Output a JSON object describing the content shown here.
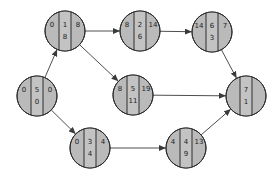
{
  "diagram": {
    "type": "network-activity-diagram",
    "node_radius": 20,
    "middle_half_width": 6,
    "colors": {
      "fill": "#bababa",
      "middle_fill": "#c3c3c3",
      "stroke": "#2e2e2e",
      "edge": "#3a3a3a",
      "text": "#222222"
    },
    "nodes": [
      {
        "id": "start",
        "cx": 37,
        "cy": 96,
        "left": "0",
        "mid_top": "5",
        "mid_bottom": "0",
        "right": "0"
      },
      {
        "id": "a",
        "cx": 65,
        "cy": 31,
        "left": "0",
        "mid_top": "1",
        "mid_bottom": "8",
        "right": "8"
      },
      {
        "id": "b",
        "cx": 140,
        "cy": 31,
        "left": "8",
        "mid_top": "2",
        "mid_bottom": "6",
        "right": "14"
      },
      {
        "id": "c",
        "cx": 212,
        "cy": 32,
        "left": "14",
        "mid_top": "6",
        "mid_bottom": "3",
        "right": "7"
      },
      {
        "id": "d",
        "cx": 133,
        "cy": 95,
        "left": "8",
        "mid_top": "5",
        "mid_bottom": "11",
        "right": "19"
      },
      {
        "id": "e",
        "cx": 90,
        "cy": 148,
        "left": "0",
        "mid_top": "3",
        "mid_bottom": "4",
        "right": "4"
      },
      {
        "id": "f",
        "cx": 186,
        "cy": 148,
        "left": "4",
        "mid_top": "4",
        "mid_bottom": "9",
        "right": "13"
      },
      {
        "id": "end",
        "cx": 246,
        "cy": 96,
        "left": "",
        "mid_top": "7",
        "mid_bottom": "1",
        "right": ""
      }
    ],
    "edges": [
      {
        "from": "start",
        "to": "a"
      },
      {
        "from": "start",
        "to": "e"
      },
      {
        "from": "a",
        "to": "b"
      },
      {
        "from": "a",
        "to": "d"
      },
      {
        "from": "b",
        "to": "c"
      },
      {
        "from": "c",
        "to": "end"
      },
      {
        "from": "d",
        "to": "end"
      },
      {
        "from": "e",
        "to": "f"
      },
      {
        "from": "f",
        "to": "end"
      }
    ]
  }
}
